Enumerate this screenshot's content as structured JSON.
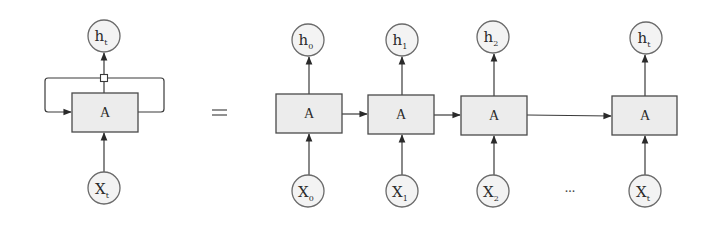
{
  "diagram": {
    "type": "recurrent-neural-network-unrolling",
    "colors": {
      "box_fill": "#ececec",
      "box_stroke": "#4a4a4a",
      "circle_fill": "#f3f3f3",
      "circle_stroke": "#6a6a6a",
      "edge": "#3a3a3a"
    },
    "rolled": {
      "cell_label": "A",
      "output": {
        "base": "h",
        "sub": "t"
      },
      "input": {
        "base": "X",
        "sub": "t"
      }
    },
    "equals_symbol": "=",
    "unrolled": {
      "steps": [
        {
          "cell_label": "A",
          "output": {
            "base": "h",
            "sub": "0"
          },
          "input": {
            "base": "X",
            "sub": "0"
          }
        },
        {
          "cell_label": "A",
          "output": {
            "base": "h",
            "sub": "1"
          },
          "input": {
            "base": "X",
            "sub": "1"
          }
        },
        {
          "cell_label": "A",
          "output": {
            "base": "h",
            "sub": "2"
          },
          "input": {
            "base": "X",
            "sub": "2"
          }
        },
        {
          "cell_label": "A",
          "output": {
            "base": "h",
            "sub": "t"
          },
          "input": {
            "base": "X",
            "sub": "t"
          }
        }
      ],
      "ellipsis": "..."
    }
  }
}
